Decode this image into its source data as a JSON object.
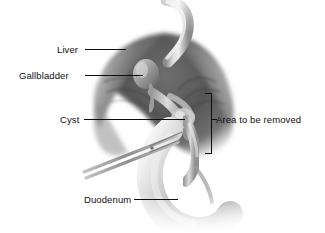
{
  "figure": {
    "background_color": "#ffffff",
    "width": 325,
    "height": 233,
    "style": "grayscale medical illustration"
  },
  "labels": {
    "liver": "Liver",
    "gallbladder": "Gallbladder",
    "cyst": "Cyst",
    "duodenum": "Duodenum",
    "area_to_be_removed": "Area to be removed"
  },
  "annotations": {
    "bracket": {
      "name": "area-to-be-removed-bracket",
      "shape": "right-square-bracket",
      "color": "#0d0d0d"
    },
    "leader_line_color": "#0d0d0d"
  },
  "anatomy": {
    "structures": [
      "liver",
      "bile duct",
      "gallbladder",
      "cyst",
      "common bile duct",
      "duodenum",
      "surgical forceps"
    ],
    "tissue_dark": "#4a4a4a",
    "tissue_mid": "#8d8d8d",
    "tissue_light": "#c9c9c9",
    "duct_highlight": "#e2e2e2",
    "instrument_color": "#a8a8a8"
  }
}
